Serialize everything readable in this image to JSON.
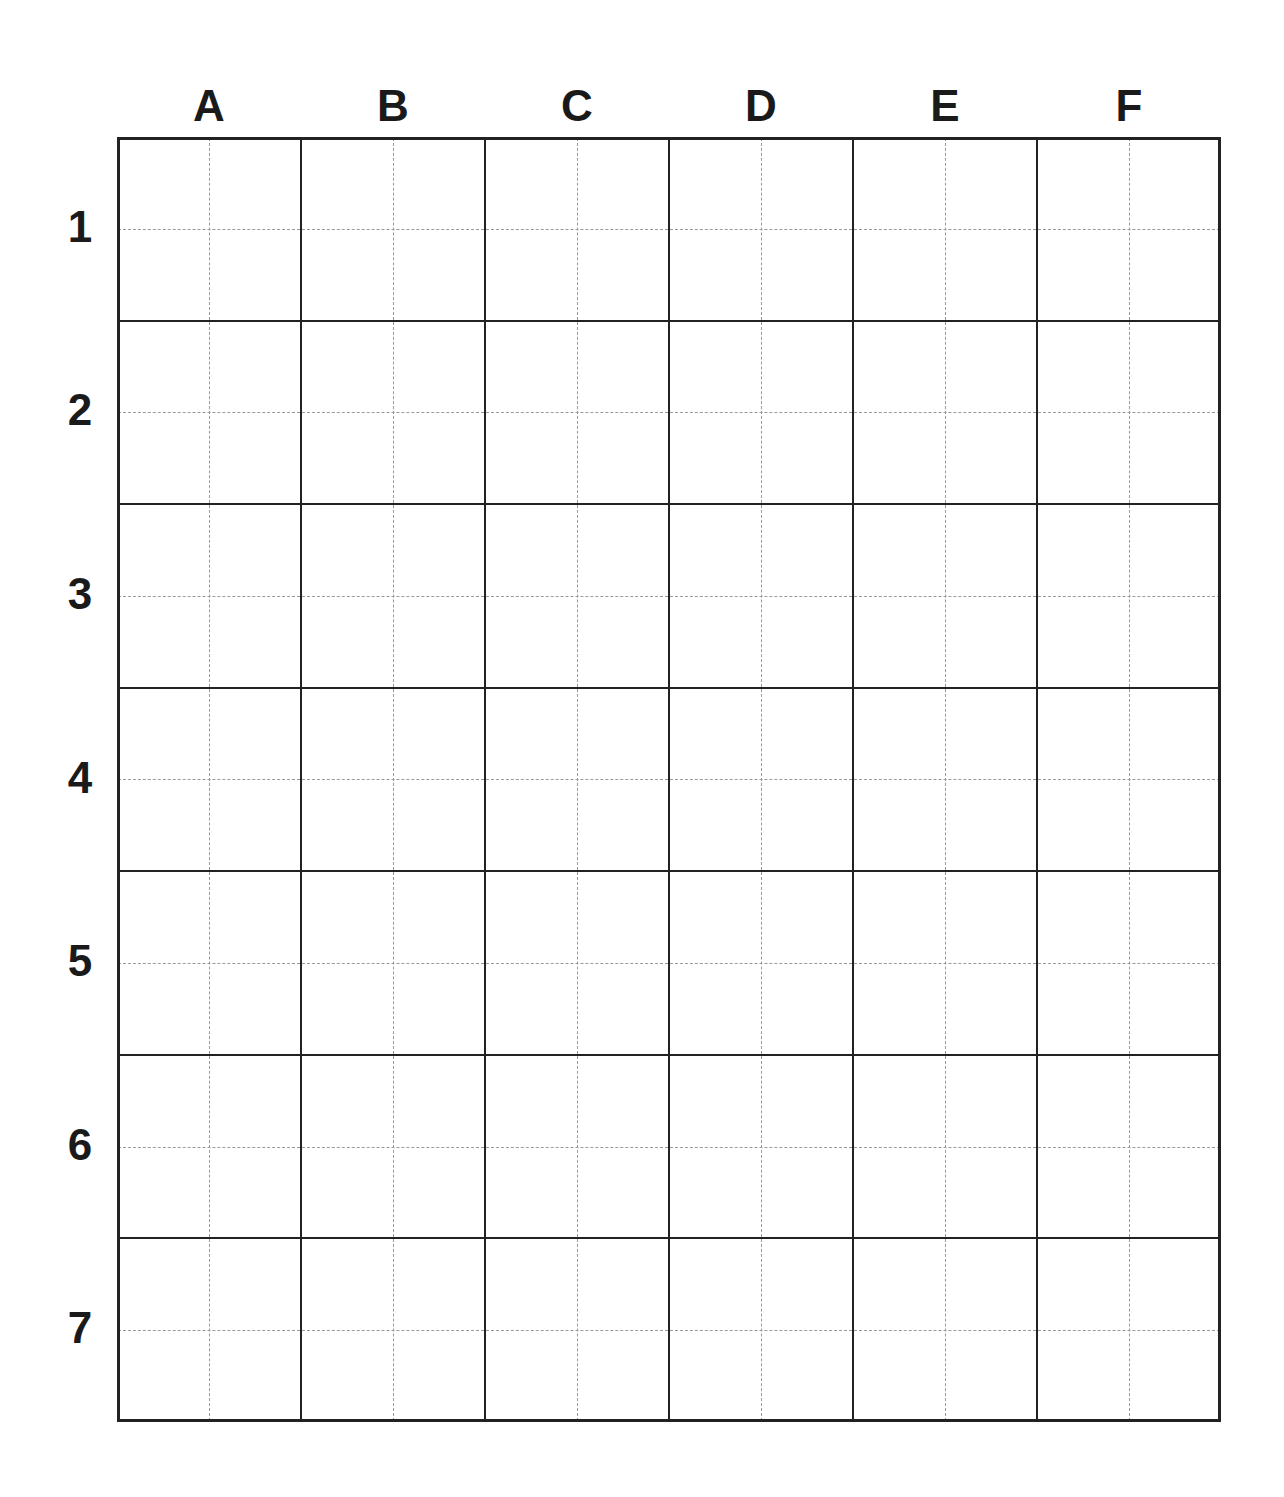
{
  "grid": {
    "columns": [
      "A",
      "B",
      "C",
      "D",
      "E",
      "F"
    ],
    "rows": [
      "1",
      "2",
      "3",
      "4",
      "5",
      "6",
      "7"
    ],
    "line_color": "#222222",
    "guide_color": "#9a9a9a"
  }
}
